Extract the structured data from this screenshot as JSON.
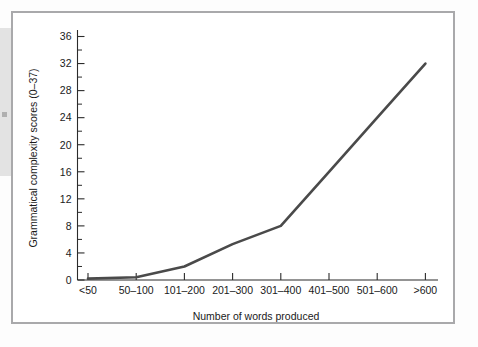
{
  "figure": {
    "frame_color": "#a9a9ab",
    "background_color": "#ffffff"
  },
  "chart_data": {
    "type": "line",
    "title": "",
    "xlabel": "Number of words produced",
    "ylabel": "Grammatical complexity scores (0–37)",
    "categories": [
      "<50",
      "50–100",
      "101–200",
      "201–300",
      "301–400",
      "401–500",
      "501–600",
      ">600"
    ],
    "values": [
      0.2,
      0.4,
      2,
      5.3,
      8,
      16,
      24,
      32
    ],
    "series": [
      {
        "name": "Grammatical complexity",
        "values": [
          0.2,
          0.4,
          2,
          5.3,
          8,
          16,
          24,
          32
        ]
      }
    ],
    "ylim": [
      0,
      37
    ],
    "ytick_labels": [
      "0",
      "4",
      "8",
      "12",
      "16",
      "20",
      "24",
      "28",
      "32",
      "36"
    ],
    "ytick_values": [
      0,
      4,
      8,
      12,
      16,
      20,
      24,
      28,
      32,
      36
    ],
    "yminor_step": 2,
    "grid": false,
    "legend": false,
    "line_color": "#4a4a4a",
    "axis_color": "#2b2b2b"
  }
}
